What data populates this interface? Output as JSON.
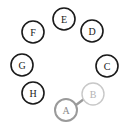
{
  "diagram": {
    "type": "graph",
    "canvas": {
      "width": 126,
      "height": 127,
      "background": "#ffffff"
    },
    "colors": {
      "node_default_stroke": "#1a1a1a",
      "node_default_label": "#1a1a1a",
      "node_selected_stroke": "#9a9a9a",
      "node_selected_label": "#8a8a8a",
      "node_faded_stroke": "#c8c8c8",
      "node_faded_label": "#b4b4b4",
      "edge_stroke": "#9a9a9a",
      "node_fill": "#ffffff"
    },
    "nodes": [
      {
        "id": "A",
        "label": "A",
        "cx": 66,
        "cy": 110,
        "r": 11,
        "state": "selected",
        "stroke": "#9a9a9a",
        "label_color": "#8a8a8a",
        "stroke_width": 2
      },
      {
        "id": "B",
        "label": "B",
        "cx": 93,
        "cy": 94,
        "r": 11,
        "state": "faded",
        "stroke": "#c8c8c8",
        "label_color": "#b4b4b4",
        "stroke_width": 1.4
      },
      {
        "id": "C",
        "label": "C",
        "cx": 107,
        "cy": 66,
        "r": 11,
        "state": "normal",
        "stroke": "#1a1a1a",
        "label_color": "#1a1a1a",
        "stroke_width": 1.6
      },
      {
        "id": "D",
        "label": "D",
        "cx": 92,
        "cy": 31,
        "r": 11,
        "state": "normal",
        "stroke": "#1a1a1a",
        "label_color": "#1a1a1a",
        "stroke_width": 1.6
      },
      {
        "id": "E",
        "label": "E",
        "cx": 64,
        "cy": 19,
        "r": 11,
        "state": "normal",
        "stroke": "#1a1a1a",
        "label_color": "#1a1a1a",
        "stroke_width": 1.6
      },
      {
        "id": "F",
        "label": "F",
        "cx": 33,
        "cy": 32,
        "r": 11,
        "state": "normal",
        "stroke": "#1a1a1a",
        "label_color": "#1a1a1a",
        "stroke_width": 1.6
      },
      {
        "id": "G",
        "label": "G",
        "cx": 22,
        "cy": 65,
        "r": 11,
        "state": "normal",
        "stroke": "#1a1a1a",
        "label_color": "#1a1a1a",
        "stroke_width": 1.6
      },
      {
        "id": "H",
        "label": "H",
        "cx": 33,
        "cy": 93,
        "r": 11,
        "state": "normal",
        "stroke": "#1a1a1a",
        "label_color": "#1a1a1a",
        "stroke_width": 1.6
      }
    ],
    "edges": [
      {
        "id": "A-B",
        "source": "A",
        "target": "B",
        "x1": 76,
        "y1": 105,
        "x2": 84,
        "y2": 99,
        "stroke": "#9a9a9a",
        "stroke_width": 2.4
      }
    ]
  }
}
